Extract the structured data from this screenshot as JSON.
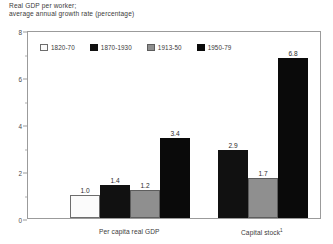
{
  "chart_data": {
    "type": "bar",
    "title": "Real GDP per worker;\naverage annual growth rate (percentage)",
    "title_line1": "Real GDP per worker;",
    "title_line2": "average annual growth rate (percentage)",
    "xlabel": "",
    "ylabel": "",
    "ylim": [
      0,
      8
    ],
    "yticks": [
      0,
      2,
      4,
      6,
      8
    ],
    "ytick_labels": [
      "0",
      "2",
      "4",
      "6",
      "8"
    ],
    "yminor_ticks": [
      1,
      3,
      5,
      7
    ],
    "grid": false,
    "legend_position": "top-left-inside",
    "categories": [
      "Per capita real GDP",
      "Capital stock"
    ],
    "category_labels": [
      "Per capita real GDP",
      "Capital stock¹"
    ],
    "category_footnotes": [
      "",
      "1"
    ],
    "series": [
      {
        "name": "1820-70",
        "color": "#fbfbfb",
        "border": "#6d6d6d",
        "values": [
          1.0,
          null
        ],
        "value_labels": [
          "1.0",
          ""
        ]
      },
      {
        "name": "1870-1930",
        "color": "#111111",
        "border": "#111111",
        "values": [
          1.4,
          2.9
        ],
        "value_labels": [
          "1.4",
          "2.9"
        ]
      },
      {
        "name": "1913-50",
        "color": "#8f8f8f",
        "border": "#5d5d5d",
        "values": [
          1.2,
          1.7
        ],
        "value_labels": [
          "1.2",
          "1.7"
        ]
      },
      {
        "name": "1950-79",
        "color": "#0a0a0a",
        "border": "#0a0a0a",
        "values": [
          3.4,
          6.8
        ],
        "value_labels": [
          "3.4",
          "6.8"
        ]
      }
    ]
  },
  "colors": {
    "frame": "#9b9b9b",
    "text": "#3a3a3a",
    "background": "#ffffff"
  }
}
